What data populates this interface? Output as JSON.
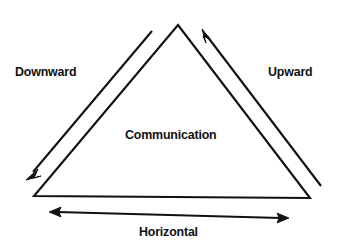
{
  "diagram": {
    "type": "triangle-flow-diagram",
    "title_label": "Communication",
    "background_color": "#ffffff",
    "stroke_color": "#111111",
    "labels": {
      "downward": "Downward",
      "upward": "Upward",
      "center": "Communication",
      "horizontal": "Horizontal"
    },
    "icons": {
      "downward_arrow": "arrow-down-left-icon",
      "upward_arrow": "arrow-up-left-icon",
      "horizontal_arrow": "arrow-left-right-icon",
      "triangle": "triangle-outline-icon"
    },
    "geometry": {
      "triangle": {
        "apex": [
          178,
          25
        ],
        "bottom_left": [
          34,
          196
        ],
        "bottom_right": [
          310,
          198
        ]
      },
      "downward_arrow": {
        "from": [
          152,
          31
        ],
        "to": [
          28,
          177
        ],
        "heads": 1
      },
      "upward_arrow": {
        "from": [
          320,
          185
        ],
        "to": [
          203,
          31
        ],
        "heads": 1
      },
      "horizontal_arrow": {
        "from": [
          50,
          212
        ],
        "to": [
          288,
          218
        ],
        "heads": 2
      }
    }
  }
}
